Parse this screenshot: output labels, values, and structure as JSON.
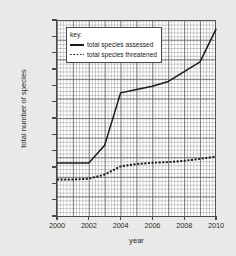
{
  "chart_data": {
    "type": "line",
    "title": "",
    "xlabel": "year",
    "ylabel": "total number of species",
    "xlim": [
      2000,
      2010
    ],
    "ylim": [
      0,
      60000
    ],
    "grid": true,
    "legend_position": "top-left-inside",
    "legend_title": "key:",
    "x": [
      2000,
      2001,
      2002,
      2003,
      2004,
      2005,
      2006,
      2007,
      2008,
      2009,
      2010
    ],
    "xticks": [
      "2000",
      "2002",
      "2004",
      "2006",
      "2008",
      "2010"
    ],
    "xtick_values": [
      2000,
      2002,
      2004,
      2006,
      2008,
      2010
    ],
    "yticks": [
      "0",
      "5000",
      "10000",
      "15000",
      "20000",
      "25000",
      "30000",
      "35000",
      "40000",
      "45000",
      "50000",
      "55000",
      "60000"
    ],
    "ytick_values": [
      0,
      5000,
      10000,
      15000,
      20000,
      25000,
      30000,
      35000,
      40000,
      45000,
      50000,
      55000,
      60000
    ],
    "series": [
      {
        "name": "total species assessed",
        "style": "solid",
        "color": "#1a1a1a",
        "values": [
          16500,
          16500,
          16500,
          22000,
          38000,
          39000,
          40000,
          41500,
          44500,
          47500,
          57500
        ]
      },
      {
        "name": "total species threatened",
        "style": "dotted",
        "color": "#1a1a1a",
        "values": [
          11500,
          11500,
          11700,
          13000,
          15500,
          16200,
          16600,
          16800,
          17200,
          17800,
          18500
        ]
      }
    ]
  }
}
